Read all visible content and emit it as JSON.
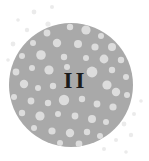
{
  "figure": {
    "label": "II",
    "label_meaning": "roman-numeral-two",
    "background_color": "#ffffff",
    "disc": {
      "fill_color": "#a9a9a9",
      "center_x": 71,
      "center_y": 85,
      "radius": 62
    },
    "speckle": {
      "inner_dot_color": "#dcdcdc",
      "outer_dot_color": "#ebebeb",
      "edge_halo_color": "#f2f2f2"
    },
    "inner_dots": [
      {
        "cx": 70,
        "cy": 27,
        "r": 3.2
      },
      {
        "cx": 86,
        "cy": 30,
        "r": 4.6
      },
      {
        "cx": 101,
        "cy": 36,
        "r": 3.0
      },
      {
        "cx": 47,
        "cy": 33,
        "r": 3.4
      },
      {
        "cx": 33,
        "cy": 43,
        "r": 3.0
      },
      {
        "cx": 57,
        "cy": 43,
        "r": 4.2
      },
      {
        "cx": 78,
        "cy": 44,
        "r": 4.0
      },
      {
        "cx": 95,
        "cy": 47,
        "r": 3.6
      },
      {
        "cx": 112,
        "cy": 47,
        "r": 4.0
      },
      {
        "cx": 22,
        "cy": 56,
        "r": 3.0
      },
      {
        "cx": 41,
        "cy": 55,
        "r": 4.8
      },
      {
        "cx": 64,
        "cy": 57,
        "r": 3.2
      },
      {
        "cx": 86,
        "cy": 58,
        "r": 3.0
      },
      {
        "cx": 104,
        "cy": 59,
        "r": 4.4
      },
      {
        "cx": 121,
        "cy": 60,
        "r": 3.2
      },
      {
        "cx": 16,
        "cy": 72,
        "r": 3.4
      },
      {
        "cx": 32,
        "cy": 68,
        "r": 3.0
      },
      {
        "cx": 49,
        "cy": 70,
        "r": 4.6
      },
      {
        "cx": 67,
        "cy": 67,
        "r": 3.0
      },
      {
        "cx": 92,
        "cy": 72,
        "r": 5.4
      },
      {
        "cx": 112,
        "cy": 70,
        "r": 3.2
      },
      {
        "cx": 126,
        "cy": 77,
        "r": 3.0
      },
      {
        "cx": 24,
        "cy": 84,
        "r": 4.2
      },
      {
        "cx": 38,
        "cy": 88,
        "r": 3.0
      },
      {
        "cx": 53,
        "cy": 86,
        "r": 3.2
      },
      {
        "cx": 107,
        "cy": 85,
        "r": 4.6
      },
      {
        "cx": 116,
        "cy": 92,
        "r": 4.2
      },
      {
        "cx": 127,
        "cy": 95,
        "r": 3.0
      },
      {
        "cx": 14,
        "cy": 97,
        "r": 3.0
      },
      {
        "cx": 31,
        "cy": 101,
        "r": 3.4
      },
      {
        "cx": 48,
        "cy": 103,
        "r": 3.2
      },
      {
        "cx": 64,
        "cy": 100,
        "r": 5.2
      },
      {
        "cx": 82,
        "cy": 99,
        "r": 3.2
      },
      {
        "cx": 97,
        "cy": 104,
        "r": 3.4
      },
      {
        "cx": 113,
        "cy": 107,
        "r": 3.6
      },
      {
        "cx": 22,
        "cy": 113,
        "r": 3.2
      },
      {
        "cx": 40,
        "cy": 116,
        "r": 4.6
      },
      {
        "cx": 58,
        "cy": 114,
        "r": 3.0
      },
      {
        "cx": 75,
        "cy": 116,
        "r": 3.4
      },
      {
        "cx": 92,
        "cy": 119,
        "r": 4.0
      },
      {
        "cx": 106,
        "cy": 122,
        "r": 3.0
      },
      {
        "cx": 34,
        "cy": 128,
        "r": 3.0
      },
      {
        "cx": 52,
        "cy": 131,
        "r": 3.6
      },
      {
        "cx": 70,
        "cy": 133,
        "r": 4.2
      },
      {
        "cx": 87,
        "cy": 132,
        "r": 3.2
      },
      {
        "cx": 100,
        "cy": 136,
        "r": 3.0
      },
      {
        "cx": 60,
        "cy": 143,
        "r": 3.0
      },
      {
        "cx": 79,
        "cy": 144,
        "r": 3.4
      }
    ],
    "outer_dots": [
      {
        "cx": 34,
        "cy": 12,
        "r": 2.4
      },
      {
        "cx": 52,
        "cy": 7,
        "r": 2.0
      },
      {
        "cx": 48,
        "cy": 24,
        "r": 2.6
      },
      {
        "cx": 27,
        "cy": 30,
        "r": 2.2
      },
      {
        "cx": 18,
        "cy": 20,
        "r": 1.8
      },
      {
        "cx": 13,
        "cy": 44,
        "r": 2.4
      },
      {
        "cx": 8,
        "cy": 60,
        "r": 1.8
      },
      {
        "cx": 36,
        "cy": 41,
        "r": 2.0
      },
      {
        "cx": 124,
        "cy": 124,
        "r": 2.4
      },
      {
        "cx": 134,
        "cy": 114,
        "r": 2.0
      },
      {
        "cx": 131,
        "cy": 135,
        "r": 2.2
      },
      {
        "cx": 116,
        "cy": 140,
        "r": 2.0
      },
      {
        "cx": 141,
        "cy": 101,
        "r": 1.8
      },
      {
        "cx": 104,
        "cy": 149,
        "r": 2.0
      },
      {
        "cx": 126,
        "cy": 152,
        "r": 1.8
      }
    ]
  }
}
